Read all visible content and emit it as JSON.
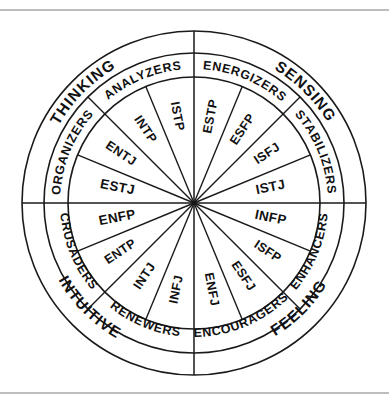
{
  "diagram": {
    "shape": "concentric-circle-wheel",
    "rings": 3,
    "background_color": "#ffffff",
    "line_color": "#1a1a1a",
    "frame_color": "#7d7d7d",
    "geometry": {
      "center_x": 194,
      "center_y": 203,
      "radius_outer": 172,
      "radius_middle": 150,
      "radius_inner": 126,
      "inner_segments": 16,
      "middle_segments": 8,
      "outer_segments": 4,
      "top_rule_y": 10,
      "bottom_rule_y": 393
    },
    "outer_ring": {
      "name": "dichotomy-ring",
      "segments": [
        {
          "label": "SENSING",
          "start_deg": -90,
          "end_deg": 0
        },
        {
          "label": "FEELING",
          "start_deg": 0,
          "end_deg": 90
        },
        {
          "label": "INTUITIVE",
          "start_deg": 90,
          "end_deg": 180
        },
        {
          "label": "THINKING",
          "start_deg": 180,
          "end_deg": 270
        }
      ]
    },
    "middle_ring": {
      "name": "temperament-ring",
      "segments": [
        {
          "label": "ENERGIZERS",
          "start_deg": -90,
          "end_deg": -45
        },
        {
          "label": "STABILIZERS",
          "start_deg": -45,
          "end_deg": 0
        },
        {
          "label": "ENHANCERS",
          "start_deg": 0,
          "end_deg": 45
        },
        {
          "label": "ENCOURAGERS",
          "start_deg": 45,
          "end_deg": 90
        },
        {
          "label": "RENEWERS",
          "start_deg": 90,
          "end_deg": 135
        },
        {
          "label": "CRUSADERS",
          "start_deg": 135,
          "end_deg": 180
        },
        {
          "label": "ORGANIZERS",
          "start_deg": 180,
          "end_deg": 225
        },
        {
          "label": "ANALYZERS",
          "start_deg": 225,
          "end_deg": 270
        }
      ]
    },
    "inner_ring": {
      "name": "type-code-ring",
      "segments": [
        {
          "label": "ESTP",
          "mid_deg": -78.75
        },
        {
          "label": "ESFP",
          "mid_deg": -56.25
        },
        {
          "label": "ISFJ",
          "mid_deg": -33.75
        },
        {
          "label": "ISTJ",
          "mid_deg": -11.25
        },
        {
          "label": "INFP",
          "mid_deg": 11.25
        },
        {
          "label": "ISFP",
          "mid_deg": 33.75
        },
        {
          "label": "ESFJ",
          "mid_deg": 56.25
        },
        {
          "label": "ENFJ",
          "mid_deg": 78.75
        },
        {
          "label": "INFJ",
          "mid_deg": 101.25
        },
        {
          "label": "INTJ",
          "mid_deg": 123.75
        },
        {
          "label": "ENTP",
          "mid_deg": 146.25
        },
        {
          "label": "ENFP",
          "mid_deg": 168.75
        },
        {
          "label": "ESTJ",
          "mid_deg": 191.25
        },
        {
          "label": "ENTJ",
          "mid_deg": 213.75
        },
        {
          "label": "INTP",
          "mid_deg": 236.25
        },
        {
          "label": "ISTP",
          "mid_deg": 258.75
        }
      ]
    }
  }
}
